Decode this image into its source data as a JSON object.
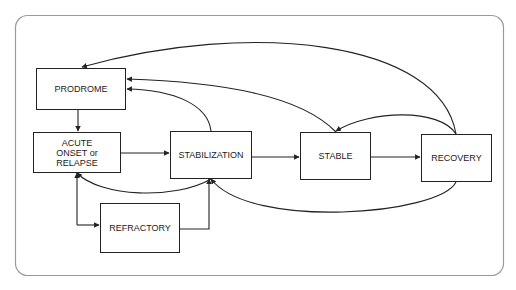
{
  "diagram": {
    "type": "state-flow",
    "nodes": [
      {
        "id": "prodrome",
        "label": "PRODROME"
      },
      {
        "id": "acute",
        "label": "ACUTE\nONSET or\nRELAPSE",
        "lines": [
          "ACUTE",
          "ONSET or",
          "RELAPSE"
        ]
      },
      {
        "id": "stabilization",
        "label": "STABILIZATION"
      },
      {
        "id": "stable",
        "label": "STABLE"
      },
      {
        "id": "recovery",
        "label": "RECOVERY"
      },
      {
        "id": "refractory",
        "label": "REFRACTORY"
      }
    ],
    "edges": [
      {
        "from": "prodrome",
        "to": "acute"
      },
      {
        "from": "acute",
        "to": "stabilization"
      },
      {
        "from": "stabilization",
        "to": "stable"
      },
      {
        "from": "stable",
        "to": "recovery"
      },
      {
        "from": "stabilization",
        "to": "prodrome"
      },
      {
        "from": "stable",
        "to": "prodrome"
      },
      {
        "from": "recovery",
        "to": "prodrome"
      },
      {
        "from": "recovery",
        "to": "stable"
      },
      {
        "from": "recovery",
        "to": "stabilization"
      },
      {
        "from": "stabilization",
        "to": "acute"
      },
      {
        "from": "acute",
        "to": "refractory"
      },
      {
        "from": "refractory",
        "to": "acute"
      },
      {
        "from": "refractory",
        "to": "stabilization"
      }
    ],
    "colors": {
      "stroke": "#222222",
      "frame": "#999999",
      "background": "#ffffff"
    }
  }
}
